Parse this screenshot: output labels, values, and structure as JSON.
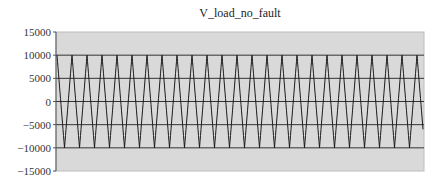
{
  "chart_data": {
    "type": "line",
    "title": "V_load_no_fault",
    "xlabel": "",
    "ylabel": "",
    "ylim": [
      -15000,
      15000
    ],
    "yticks": [
      15000,
      10000,
      5000,
      0,
      -5000,
      -10000,
      -15000
    ],
    "ytick_labels": [
      "15000",
      "10000",
      "5000",
      "0",
      "-5000",
      "-10000",
      "-15000"
    ],
    "grid": true,
    "legend": null,
    "plot_background": "#d9d9d9",
    "line_color": "#1a1a1a",
    "series": [
      {
        "name": "V_load_no_fault",
        "description": "Sinusoidal AC voltage, amplitude ~10000, approx. 24.5 cycles across the plot",
        "amplitude": 10000,
        "cycles": 24.5,
        "phase": "starts at positive peak"
      }
    ]
  }
}
